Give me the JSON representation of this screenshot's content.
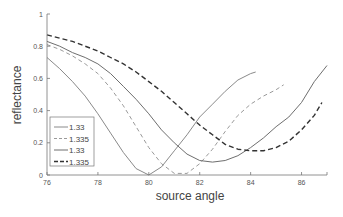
{
  "chart_data": {
    "type": "line",
    "title": "",
    "xlabel": "source angle",
    "ylabel": "reflectance",
    "xlim": [
      76,
      87
    ],
    "ylim": [
      0,
      1
    ],
    "xticks": [
      76,
      78,
      80,
      82,
      84,
      86
    ],
    "yticks": [
      0,
      0.2,
      0.4,
      0.6,
      0.8,
      1
    ],
    "ytick_labels": [
      "0",
      "0.2",
      "0.4",
      "0.6",
      "0.8",
      "1"
    ],
    "grid": false,
    "legend_position": "lower left (inside)",
    "series": [
      {
        "name": "1.33",
        "style": "solid",
        "color": "#8a8a8a",
        "x": [
          76,
          76.5,
          77,
          77.5,
          78,
          78.5,
          79,
          79.5,
          80,
          80.5,
          81,
          81.5,
          82,
          82.5,
          83,
          83.5,
          84,
          84.2
        ],
        "y": [
          0.73,
          0.66,
          0.58,
          0.49,
          0.38,
          0.26,
          0.14,
          0.04,
          0.0,
          0.05,
          0.15,
          0.25,
          0.36,
          0.44,
          0.52,
          0.59,
          0.63,
          0.64
        ]
      },
      {
        "name": "1.335",
        "style": "dashed",
        "color": "#9a9a9a",
        "x": [
          76,
          76.5,
          77,
          77.5,
          78,
          78.5,
          79,
          79.5,
          80,
          80.5,
          81,
          81.5,
          82,
          82.5,
          83,
          83.5,
          84,
          84.5,
          85,
          85.3
        ],
        "y": [
          0.81,
          0.78,
          0.74,
          0.69,
          0.63,
          0.54,
          0.43,
          0.3,
          0.17,
          0.07,
          0.01,
          0.01,
          0.07,
          0.16,
          0.27,
          0.37,
          0.44,
          0.49,
          0.53,
          0.56
        ]
      },
      {
        "name": "1.33",
        "style": "solid",
        "color": "#6e6e6e",
        "x": [
          76,
          76.5,
          77,
          77.5,
          78,
          78.5,
          79,
          79.5,
          80,
          80.5,
          81,
          81.5,
          82,
          82.5,
          83,
          83.5,
          84,
          84.5,
          85,
          85.5,
          86,
          86.5,
          87
        ],
        "y": [
          0.83,
          0.8,
          0.76,
          0.73,
          0.69,
          0.63,
          0.55,
          0.47,
          0.38,
          0.28,
          0.2,
          0.13,
          0.09,
          0.08,
          0.09,
          0.12,
          0.17,
          0.23,
          0.3,
          0.36,
          0.45,
          0.58,
          0.68
        ]
      },
      {
        "name": "1.335",
        "style": "dashed",
        "color": "#333333",
        "x": [
          76,
          76.5,
          77,
          77.5,
          78,
          78.5,
          79,
          79.5,
          80,
          80.5,
          81,
          81.5,
          82,
          82.5,
          83,
          83.5,
          84,
          84.5,
          85,
          85.5,
          86,
          86.5,
          86.8
        ],
        "y": [
          0.87,
          0.85,
          0.83,
          0.8,
          0.77,
          0.73,
          0.69,
          0.64,
          0.58,
          0.52,
          0.45,
          0.38,
          0.31,
          0.25,
          0.19,
          0.16,
          0.15,
          0.15,
          0.17,
          0.21,
          0.28,
          0.37,
          0.45
        ]
      }
    ]
  }
}
